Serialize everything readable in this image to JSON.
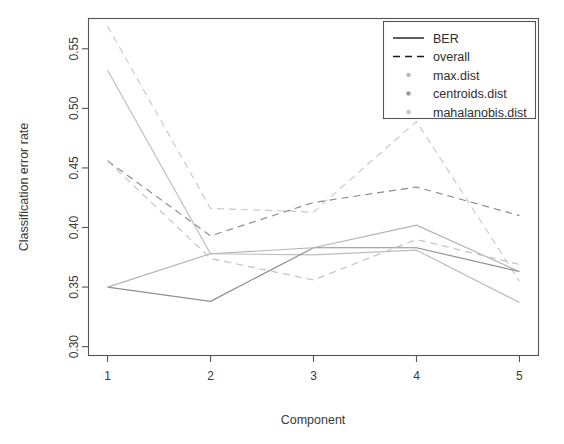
{
  "chart_data": {
    "type": "line",
    "title": "",
    "xlabel": "Component",
    "ylabel": "Classification error rate",
    "x": [
      1,
      2,
      3,
      4,
      5
    ],
    "categories": [
      "1",
      "2",
      "3",
      "4",
      "5"
    ],
    "xtick_labels": [
      "1",
      "2",
      "3",
      "4",
      "5"
    ],
    "ytick_labels": [
      "0.30",
      "0.35",
      "0.40",
      "0.45",
      "0.50",
      "0.55"
    ],
    "ytick_values": [
      0.3,
      0.35,
      0.4,
      0.45,
      0.5,
      0.55
    ],
    "xlim": [
      0.82,
      5.18
    ],
    "ylim": [
      0.293,
      0.575
    ],
    "grid": false,
    "legend_position": "top-right",
    "legend_entries": [
      {
        "label": "BER",
        "style": "solid",
        "swatch": "line-solid",
        "color": "#1a1a1a"
      },
      {
        "label": "overall",
        "style": "dashed",
        "swatch": "line-dashed",
        "color": "#1a1a1a"
      },
      {
        "label": "max.dist",
        "style": "marker",
        "swatch": "dot",
        "color": "#b9b9b9"
      },
      {
        "label": "centroids.dist",
        "style": "marker",
        "swatch": "dot",
        "color": "#9a9a9a"
      },
      {
        "label": "mahalanobis.dist",
        "style": "marker",
        "swatch": "dot",
        "color": "#c4c4c4"
      }
    ],
    "series": [
      {
        "name": "max.dist BER",
        "distance": "max.dist",
        "metric": "BER",
        "style": "solid",
        "color": "#bdbdbd",
        "values": [
          0.532,
          0.378,
          0.377,
          0.381,
          0.337
        ]
      },
      {
        "name": "max.dist overall",
        "distance": "max.dist",
        "metric": "overall",
        "style": "dashed",
        "color": "#c9c9c9",
        "values": [
          0.569,
          0.416,
          0.413,
          0.489,
          0.355
        ]
      },
      {
        "name": "centroids.dist BER",
        "distance": "centroids.dist",
        "metric": "BER",
        "style": "solid",
        "color": "#8f8f8f",
        "values": [
          0.35,
          0.338,
          0.383,
          0.383,
          0.363
        ]
      },
      {
        "name": "centroids.dist overall",
        "distance": "centroids.dist",
        "metric": "overall",
        "style": "dashed",
        "color": "#8a8a8a",
        "values": [
          0.456,
          0.393,
          0.421,
          0.434,
          0.41
        ]
      },
      {
        "name": "mahalanobis.dist BER",
        "distance": "mahalanobis.dist",
        "metric": "BER",
        "style": "solid",
        "color": "#b4b4b4",
        "values": [
          0.35,
          0.378,
          0.383,
          0.402,
          0.363
        ]
      },
      {
        "name": "mahalanobis.dist overall",
        "distance": "mahalanobis.dist",
        "metric": "overall",
        "style": "dashed",
        "color": "#c0c0c0",
        "values": [
          0.456,
          0.374,
          0.356,
          0.39,
          0.369
        ]
      }
    ]
  },
  "axes": {
    "x_title": "Component",
    "y_title": "Classification error rate"
  },
  "legend": {
    "items": [
      {
        "label": "BER"
      },
      {
        "label": "overall"
      },
      {
        "label": "max.dist"
      },
      {
        "label": "centroids.dist"
      },
      {
        "label": "mahalanobis.dist"
      }
    ]
  }
}
